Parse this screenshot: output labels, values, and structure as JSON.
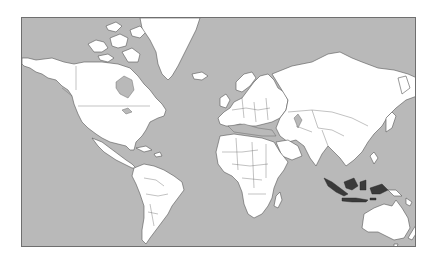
{
  "map": {
    "type": "world-political-outline",
    "projection": "Mercator",
    "highlighted_region": "Indonesia",
    "colors": {
      "ocean": "#b9b9b9",
      "land": "#ffffff",
      "highlight": "#3a3a3a",
      "frame": "#6f6f6f",
      "background": "#ffffff"
    }
  }
}
